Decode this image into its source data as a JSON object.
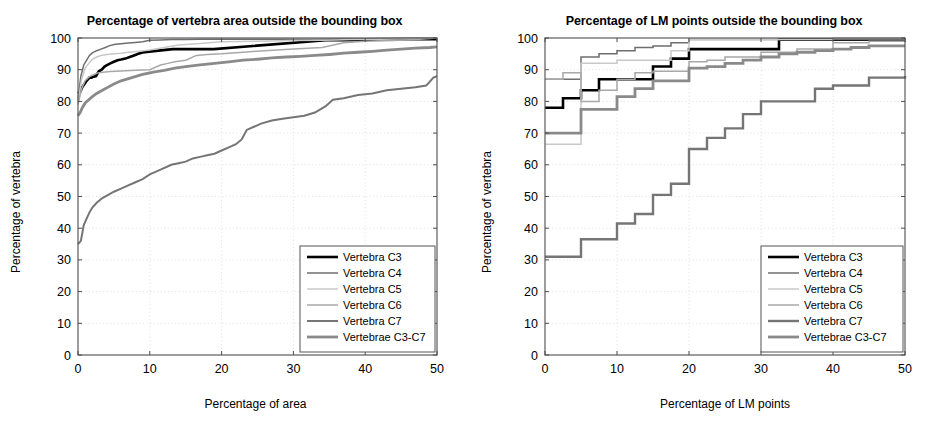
{
  "figure": {
    "width": 943,
    "height": 423,
    "background": "#ffffff"
  },
  "chart_data": [
    {
      "type": "line",
      "panel": "left",
      "title": "Percentage of vertebra area outside the bounding box",
      "xlabel": "Percentage of area",
      "ylabel": "Percentage of vertebra",
      "xlim": [
        0,
        50
      ],
      "ylim": [
        0,
        100
      ],
      "xticks": [
        0,
        10,
        20,
        30,
        40,
        50
      ],
      "yticks": [
        0,
        10,
        20,
        30,
        40,
        50,
        60,
        70,
        80,
        90,
        100
      ],
      "grid": true,
      "legend_position": "lower right",
      "series": [
        {
          "name": "Vertebra C3",
          "color": "#000000",
          "width": 2.6,
          "x": [
            0,
            0.3,
            0.6,
            0.9,
            1.2,
            1.6,
            1.9,
            2.2,
            2.5,
            2.9,
            3.3,
            3.7,
            4.1,
            4.5,
            5.0,
            5.5,
            6.0,
            6.6,
            7.2,
            7.8,
            8.4,
            9.0,
            9.6,
            9.9,
            13.2,
            13.8,
            15.0,
            16.5,
            18.0,
            18.9,
            34.5,
            35.4,
            36.6,
            37.5,
            38.1,
            43.2,
            44.4,
            46.0,
            48.0,
            50.0
          ],
          "y": [
            82.5,
            83.0,
            84.5,
            85.5,
            86.5,
            87.5,
            87.5,
            87.8,
            88.0,
            89.5,
            90.0,
            91.0,
            91.5,
            92.0,
            92.5,
            93.0,
            93.2,
            93.5,
            94.0,
            94.5,
            95.0,
            95.4,
            95.6,
            95.7,
            96.5,
            96.5,
            96.5,
            96.5,
            96.5,
            96.5,
            99.3,
            99.3,
            99.3,
            99.3,
            99.3,
            99.6,
            99.6,
            99.6,
            99.6,
            99.6
          ]
        },
        {
          "name": "Vertebra C4",
          "color": "#6e6e6e",
          "width": 1.5,
          "x": [
            0,
            0.4,
            0.8,
            1.2,
            1.6,
            2.0,
            2.6,
            3.2,
            3.8,
            4.4,
            5.2,
            6.0,
            7.0,
            8.0,
            9.0,
            10.0,
            11.5,
            13.0,
            15.0,
            17.0,
            20.0,
            24.0,
            28.0,
            32.0,
            36.0,
            40.0,
            45.0,
            50.0
          ],
          "y": [
            80.5,
            88.0,
            91.5,
            93.0,
            94.5,
            95.3,
            96.0,
            96.5,
            97.0,
            97.6,
            98.0,
            98.2,
            98.4,
            98.6,
            98.8,
            99.3,
            99.4,
            99.5,
            99.5,
            99.6,
            99.6,
            99.6,
            99.6,
            99.6,
            99.7,
            99.8,
            99.9,
            100.0
          ]
        },
        {
          "name": "Vertebra C5",
          "color": "#c8c8c8",
          "width": 1.5,
          "x": [
            0,
            0.5,
            1.0,
            1.5,
            2.0,
            2.6,
            3.2,
            4.0,
            5.0,
            6.0,
            7.0,
            8.5,
            10.0,
            12.0,
            14.0,
            17.0,
            20.0,
            25.0,
            30.0,
            34.0,
            36.0,
            38.0,
            42.0,
            46.0,
            50.0
          ],
          "y": [
            79.5,
            87.0,
            90.5,
            92.0,
            93.3,
            94.0,
            94.5,
            94.8,
            95.0,
            95.2,
            95.5,
            95.8,
            96.2,
            97.0,
            97.8,
            98.3,
            98.8,
            99.0,
            99.2,
            99.3,
            99.4,
            99.5,
            99.6,
            99.8,
            100.0
          ]
        },
        {
          "name": "Vertebra C6",
          "color": "#a8a8a8",
          "width": 1.5,
          "x": [
            0,
            0.5,
            1.0,
            1.6,
            2.2,
            2.8,
            3.5,
            4.5,
            6.0,
            8.0,
            10.0,
            11.5,
            12.5,
            13.5,
            15.0,
            16.5,
            18.0,
            20.0,
            23.0,
            26.0,
            30.0,
            34.0,
            37.0,
            40.0,
            44.0,
            47.0,
            50.0
          ],
          "y": [
            79.0,
            84.0,
            86.5,
            87.8,
            88.5,
            89.0,
            89.2,
            89.4,
            89.6,
            89.8,
            90.0,
            91.5,
            92.0,
            92.5,
            93.0,
            94.5,
            94.8,
            95.0,
            95.5,
            96.0,
            96.5,
            97.0,
            98.5,
            99.0,
            99.2,
            99.5,
            100.0
          ]
        },
        {
          "name": "Vertebra C7",
          "color": "#757575",
          "width": 2.0,
          "x": [
            0,
            0.4,
            0.8,
            1.2,
            1.6,
            2.0,
            2.6,
            3.4,
            4.2,
            5.0,
            6.0,
            7.0,
            8.0,
            9.0,
            10.0,
            11.5,
            13.0,
            14.0,
            15.0,
            16.0,
            17.0,
            18.0,
            19.0,
            20.0,
            21.0,
            22.0,
            22.8,
            23.5,
            24.5,
            25.5,
            27.0,
            28.5,
            30.0,
            31.5,
            33.0,
            34.5,
            35.5,
            37.0,
            39.0,
            41.0,
            43.0,
            45.0,
            47.0,
            48.5,
            49.5,
            50.0
          ],
          "y": [
            35.0,
            36.0,
            41.0,
            43.0,
            45.0,
            46.5,
            48.0,
            49.5,
            50.5,
            51.5,
            52.5,
            53.5,
            54.5,
            55.5,
            57.0,
            58.5,
            60.0,
            60.5,
            61.0,
            62.0,
            62.5,
            63.0,
            63.5,
            64.5,
            65.5,
            66.5,
            68.0,
            71.0,
            72.0,
            73.0,
            74.0,
            74.5,
            75.0,
            75.5,
            76.5,
            78.5,
            80.5,
            81.0,
            82.0,
            82.5,
            83.5,
            84.0,
            84.5,
            85.0,
            87.5,
            88.0
          ]
        },
        {
          "name": "Vertebrae C3-C7",
          "color": "#8a8a8a",
          "width": 2.8,
          "x": [
            0,
            0.3,
            0.6,
            1.0,
            1.5,
            2.0,
            2.6,
            3.4,
            4.2,
            5.0,
            6.0,
            7.5,
            9.0,
            10.5,
            12.0,
            13.5,
            15.0,
            17.0,
            19.0,
            21.0,
            23.0,
            25.0,
            27.0,
            29.0,
            31.0,
            33.0,
            35.0,
            37.0,
            39.0,
            41.0,
            43.0,
            45.0,
            47.0,
            49.0,
            50.0
          ],
          "y": [
            75.5,
            76.5,
            78.0,
            79.5,
            80.5,
            81.5,
            82.5,
            83.5,
            84.5,
            85.5,
            86.5,
            87.5,
            88.5,
            89.2,
            89.8,
            90.5,
            91.0,
            91.5,
            92.0,
            92.5,
            93.0,
            93.3,
            93.7,
            94.0,
            94.2,
            94.5,
            94.8,
            95.2,
            95.5,
            95.8,
            96.2,
            96.5,
            96.8,
            97.0,
            97.2
          ]
        }
      ]
    },
    {
      "type": "line",
      "panel": "right",
      "title": "Percentage of LM points outside the bounding box",
      "xlabel": "Percentage of LM points",
      "ylabel": "Percentage of vertebra",
      "xlim": [
        0,
        50
      ],
      "ylim": [
        0,
        100
      ],
      "xticks": [
        0,
        10,
        20,
        30,
        40,
        50
      ],
      "yticks": [
        0,
        10,
        20,
        30,
        40,
        50,
        60,
        70,
        80,
        90,
        100
      ],
      "grid": true,
      "legend_position": "lower right",
      "series": [
        {
          "name": "Vertebra C3",
          "color": "#000000",
          "width": 2.6,
          "step": true,
          "x": [
            0,
            2.5,
            5,
            7.5,
            10,
            12.5,
            15,
            17.5,
            20,
            30,
            32.5,
            40,
            42.5,
            47.5,
            50
          ],
          "y": [
            78.0,
            81.0,
            83.5,
            87.0,
            87.0,
            87.0,
            91.0,
            93.5,
            96.5,
            96.5,
            99.5,
            99.5,
            99.5,
            99.5,
            99.5
          ]
        },
        {
          "name": "Vertebra C4",
          "color": "#6e6e6e",
          "width": 1.5,
          "step": true,
          "x": [
            0,
            2.5,
            5,
            7.5,
            10,
            12.5,
            15,
            17.5,
            20,
            25,
            30,
            35,
            40,
            45,
            50
          ],
          "y": [
            87.0,
            87.0,
            94.0,
            95.0,
            96.0,
            97.0,
            97.5,
            98.5,
            99.5,
            99.5,
            99.5,
            99.5,
            99.5,
            99.5,
            99.5
          ]
        },
        {
          "name": "Vertebra C5",
          "color": "#c8c8c8",
          "width": 1.5,
          "step": true,
          "x": [
            0,
            2.5,
            5,
            7.5,
            10,
            12.5,
            15,
            17.5,
            20,
            25,
            30,
            35,
            40,
            45,
            50
          ],
          "y": [
            66.5,
            66.5,
            92.0,
            92.0,
            93.0,
            93.0,
            93.0,
            96.0,
            99.5,
            99.5,
            99.5,
            99.5,
            100.0,
            100.0,
            100.0
          ]
        },
        {
          "name": "Vertebra C6",
          "color": "#a8a8a8",
          "width": 1.5,
          "step": true,
          "x": [
            0,
            2.5,
            5,
            7.5,
            10,
            12.5,
            15,
            17.5,
            20,
            22.5,
            25,
            30,
            35,
            40,
            45,
            50
          ],
          "y": [
            87.0,
            89.0,
            80.0,
            83.5,
            87.0,
            89.0,
            89.5,
            89.5,
            92.5,
            93.0,
            94.0,
            95.5,
            96.5,
            98.5,
            99.0,
            100.0
          ]
        },
        {
          "name": "Vertebra C7",
          "color": "#757575",
          "width": 2.4,
          "step": true,
          "x": [
            0,
            2.5,
            5,
            7.5,
            10,
            12.5,
            15,
            17.5,
            20,
            22.5,
            25,
            27.5,
            30,
            32.5,
            35,
            37.5,
            40,
            42.5,
            45,
            47.5,
            50
          ],
          "y": [
            31.0,
            31.0,
            36.5,
            36.5,
            41.5,
            44.5,
            50.5,
            54.0,
            65.0,
            68.5,
            71.5,
            76.0,
            80.0,
            80.0,
            80.0,
            84.0,
            85.0,
            85.0,
            87.5,
            87.5,
            88.0
          ]
        },
        {
          "name": "Vertebrae C3-C7",
          "color": "#8a8a8a",
          "width": 2.8,
          "step": true,
          "x": [
            0,
            2.5,
            5,
            7.5,
            10,
            12.5,
            15,
            17.5,
            20,
            22.5,
            25,
            27.5,
            30,
            32.5,
            35,
            37.5,
            40,
            42.5,
            45,
            47.5,
            50
          ],
          "y": [
            70.0,
            70.0,
            77.5,
            77.5,
            81.5,
            84.0,
            86.5,
            86.5,
            90.5,
            91.0,
            92.0,
            93.0,
            94.0,
            95.0,
            95.5,
            96.0,
            96.5,
            97.0,
            97.5,
            97.5,
            97.5
          ]
        }
      ]
    }
  ]
}
